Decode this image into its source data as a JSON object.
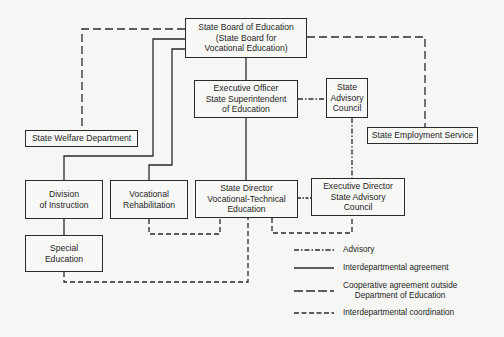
{
  "diagram": {
    "type": "organization-chart",
    "boxes": {
      "state_board": {
        "lines": [
          "State Board of Education",
          "(State Board for",
          "Vocational Education)"
        ]
      },
      "executive_officer": {
        "lines": [
          "Executive Officer",
          "State Superintendent",
          "of Education"
        ]
      },
      "state_advisory_council": {
        "lines": [
          "State",
          "Advisory",
          "Council"
        ]
      },
      "state_welfare": {
        "lines": [
          "State Welfare Department"
        ]
      },
      "state_employment": {
        "lines": [
          "State Employment Service"
        ]
      },
      "division_instruction": {
        "lines": [
          "Division",
          "of Instruction"
        ]
      },
      "vocational_rehab": {
        "lines": [
          "Vocational",
          "Rehabilitation"
        ]
      },
      "state_director": {
        "lines": [
          "State Director",
          "Vocational-Technical",
          "Education"
        ]
      },
      "executive_director": {
        "lines": [
          "Executive Director",
          "State Advisory",
          "Council"
        ]
      },
      "special_education": {
        "lines": [
          "Special",
          "Education"
        ]
      }
    },
    "connections": [
      {
        "from": "State Board of Education",
        "to": "Executive Officer State Superintendent of Education",
        "style": "solid"
      },
      {
        "from": "Executive Officer State Superintendent of Education",
        "to": "State Director Vocational-Technical Education",
        "style": "solid"
      },
      {
        "from": "State Board of Education",
        "to": "Division of Instruction",
        "style": "solid"
      },
      {
        "from": "State Board of Education",
        "to": "Vocational Rehabilitation",
        "style": "solid"
      },
      {
        "from": "Division of Instruction",
        "to": "Special Education",
        "style": "solid"
      },
      {
        "from": "State Board of Education",
        "to": "State Welfare Department",
        "style": "long-dash"
      },
      {
        "from": "State Board of Education",
        "to": "State Employment Service",
        "style": "long-dash"
      },
      {
        "from": "Executive Officer State Superintendent of Education",
        "to": "State Advisory Council",
        "style": "dash-dot"
      },
      {
        "from": "State Advisory Council",
        "to": "Executive Director State Advisory Council",
        "style": "dash-dot"
      },
      {
        "from": "State Director Vocational-Technical Education",
        "to": "Executive Director State Advisory Council",
        "style": "dash-dot"
      },
      {
        "from": "Vocational Rehabilitation",
        "to": "State Director Vocational-Technical Education",
        "style": "short-dash"
      },
      {
        "from": "State Director Vocational-Technical Education",
        "to": "Executive Director State Advisory Council",
        "style": "short-dash"
      },
      {
        "from": "Special Education",
        "to": "State Director Vocational-Technical Education",
        "style": "short-dash"
      }
    ]
  },
  "legend": {
    "advisory": "Advisory",
    "interdepartmental_agreement": "Interdepartmental agreement",
    "cooperative_line1": "Cooperative agreement outside",
    "cooperative_line2": "Department of Education",
    "interdepartmental_coordination": "Interdepartmental coordination"
  },
  "colors": {
    "line": "#2a2a2a",
    "background": "#f6f6f4"
  }
}
